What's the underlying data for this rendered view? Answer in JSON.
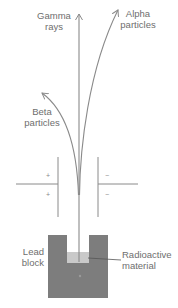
{
  "diagram": {
    "title": "",
    "colors": {
      "line": "#8a8a8a",
      "lead_block": "#7d7d7d",
      "radioactive_material": "#c9c9c9",
      "text": "#6e6e6e",
      "background": "#ffffff"
    },
    "rays": [
      {
        "id": "gamma",
        "label_line1": "Gamma",
        "label_line2": "rays",
        "deflection": "none"
      },
      {
        "id": "alpha",
        "label_line1": "Alpha",
        "label_line2": "particles",
        "deflection": "toward negative plate (slight)"
      },
      {
        "id": "beta",
        "label_line1": "Beta",
        "label_line2": "particles",
        "deflection": "toward positive plate (strong)"
      }
    ],
    "plates": {
      "left": {
        "sign_top": "+",
        "sign_bottom": "+",
        "charge": "positive"
      },
      "right": {
        "sign_top": "−",
        "sign_bottom": "−",
        "charge": "negative"
      }
    },
    "labels": {
      "lead_line1": "Lead",
      "lead_line2": "block",
      "material_line1": "Radioactive",
      "material_line2": "material"
    }
  }
}
